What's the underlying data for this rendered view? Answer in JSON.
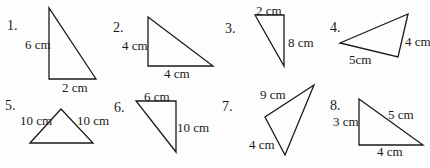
{
  "title": "",
  "triangles": [
    {
      "number": "1.",
      "points": "49,8 49,79 96,79",
      "num_pos": [
        7,
        30
      ],
      "labels": [
        {
          "text": "6 cm",
          "x": 25,
          "y": 49
        },
        {
          "text": "2 cm",
          "x": 62,
          "y": 92
        }
      ]
    },
    {
      "number": "2.",
      "points": "148,17 148,66 213,66",
      "num_pos": [
        113,
        32
      ],
      "labels": [
        {
          "text": "4 cm",
          "x": 122,
          "y": 50
        },
        {
          "text": "4 cm",
          "x": 164,
          "y": 78
        }
      ]
    },
    {
      "number": "3.",
      "points": "255,15 284,15 284,66",
      "num_pos": [
        225,
        33
      ],
      "labels": [
        {
          "text": "2 cm",
          "x": 256,
          "y": 15
        },
        {
          "text": "8 cm",
          "x": 288,
          "y": 47
        }
      ]
    },
    {
      "number": "4.",
      "points": "340,43 408,14 398,57",
      "num_pos": [
        330,
        32
      ],
      "labels": [
        {
          "text": "4 cm",
          "x": 405,
          "y": 46
        },
        {
          "text": "5cm",
          "x": 349,
          "y": 64
        }
      ]
    },
    {
      "number": "5.",
      "points": "30,143 61,109 93,143",
      "num_pos": [
        5,
        110
      ],
      "labels": [
        {
          "text": "10 cm",
          "x": 20,
          "y": 125
        },
        {
          "text": "10 cm",
          "x": 77,
          "y": 125
        }
      ]
    },
    {
      "number": "6.",
      "points": "136,101 176,101 176,152",
      "num_pos": [
        114,
        112
      ],
      "labels": [
        {
          "text": "6 cm",
          "x": 144,
          "y": 101
        },
        {
          "text": "10 cm",
          "x": 177,
          "y": 132
        }
      ]
    },
    {
      "number": "7.",
      "points": "314,85 265,117 285,155",
      "num_pos": [
        222,
        111
      ],
      "labels": [
        {
          "text": "9 cm",
          "x": 260,
          "y": 99
        },
        {
          "text": "4 cm",
          "x": 249,
          "y": 149
        }
      ]
    },
    {
      "number": "8.",
      "points": "359,99 359,145 423,145",
      "num_pos": [
        330,
        110
      ],
      "labels": [
        {
          "text": "3 cm",
          "x": 333,
          "y": 126
        },
        {
          "text": "5 cm",
          "x": 388,
          "y": 119
        },
        {
          "text": "4 cm",
          "x": 377,
          "y": 156
        }
      ]
    }
  ]
}
